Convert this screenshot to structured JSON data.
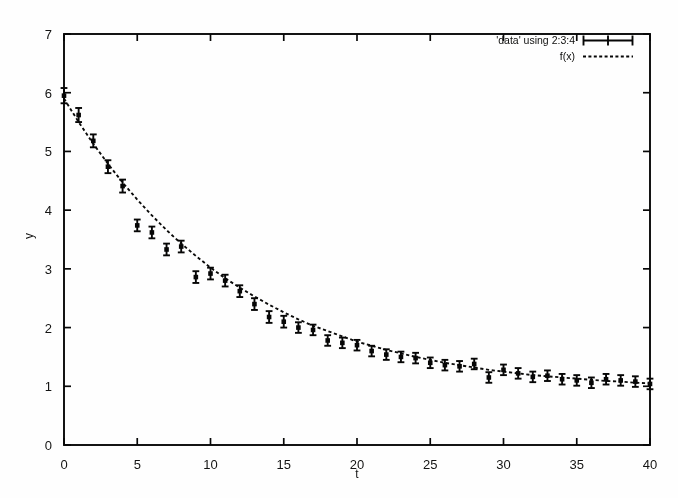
{
  "figure": {
    "kind": "gnuplot-scatter-with-errorbars-and-fit",
    "background_color": "#fdfdfc",
    "ink_color": "#0d0d0d"
  },
  "legend": {
    "position": "top-right-inside",
    "entries": [
      {
        "label": "'data' using 2:3:4",
        "key": "errorbar-key",
        "color": "#0b0b0b"
      },
      {
        "label": "f(x)",
        "key": "dashed-line-key",
        "color": "#0b0b0b"
      }
    ]
  },
  "axes": {
    "x": {
      "label": "t",
      "min": 0,
      "max": 40,
      "ticks": [
        0,
        5,
        10,
        15,
        20,
        25,
        30,
        35,
        40
      ]
    },
    "y": {
      "label": "y",
      "min": 0,
      "max": 7,
      "ticks": [
        0,
        1,
        2,
        3,
        4,
        5,
        6,
        7
      ]
    }
  },
  "chart_data": {
    "type": "scatter",
    "title": "",
    "xlabel": "t",
    "ylabel": "y",
    "xlim": [
      0,
      40
    ],
    "ylim": [
      0,
      7
    ],
    "grid": false,
    "legend_position": "top right inside",
    "series": [
      {
        "name": "'data' using 2:3:4",
        "style": "points-with-yerrorbars",
        "x": [
          0,
          1,
          2,
          3,
          4,
          5,
          6,
          7,
          8,
          9,
          10,
          11,
          12,
          13,
          14,
          15,
          16,
          17,
          18,
          19,
          20,
          21,
          22,
          23,
          24,
          25,
          26,
          27,
          28,
          29,
          30,
          31,
          32,
          33,
          34,
          35,
          36,
          37,
          38,
          39,
          40
        ],
        "y": [
          5.95,
          5.62,
          5.18,
          4.74,
          4.41,
          3.74,
          3.62,
          3.33,
          3.38,
          2.86,
          2.92,
          2.8,
          2.62,
          2.4,
          2.18,
          2.1,
          2.0,
          1.96,
          1.78,
          1.74,
          1.7,
          1.6,
          1.54,
          1.5,
          1.48,
          1.4,
          1.36,
          1.34,
          1.38,
          1.15,
          1.28,
          1.22,
          1.16,
          1.18,
          1.12,
          1.1,
          1.06,
          1.12,
          1.1,
          1.08,
          1.04
        ],
        "yerr": [
          0.13,
          0.12,
          0.11,
          0.11,
          0.11,
          0.1,
          0.1,
          0.1,
          0.1,
          0.1,
          0.1,
          0.1,
          0.1,
          0.1,
          0.1,
          0.1,
          0.09,
          0.09,
          0.09,
          0.09,
          0.09,
          0.09,
          0.09,
          0.09,
          0.09,
          0.09,
          0.09,
          0.09,
          0.09,
          0.09,
          0.09,
          0.09,
          0.09,
          0.09,
          0.09,
          0.09,
          0.09,
          0.09,
          0.09,
          0.09,
          0.09
        ]
      },
      {
        "name": "f(x)",
        "style": "dashed-line",
        "description": "exponential decay fit with constant offset",
        "x": [
          0,
          1,
          2,
          3,
          4,
          5,
          6,
          7,
          8,
          9,
          10,
          11,
          12,
          13,
          14,
          15,
          16,
          17,
          18,
          19,
          20,
          21,
          22,
          23,
          24,
          25,
          26,
          27,
          28,
          29,
          30,
          31,
          32,
          33,
          34,
          35,
          36,
          37,
          38,
          39,
          40
        ],
        "y": [
          5.9,
          5.5,
          5.13,
          4.79,
          4.47,
          4.18,
          3.91,
          3.66,
          3.43,
          3.22,
          3.02,
          2.84,
          2.68,
          2.53,
          2.39,
          2.26,
          2.14,
          2.03,
          1.94,
          1.85,
          1.76,
          1.69,
          1.62,
          1.56,
          1.5,
          1.45,
          1.4,
          1.36,
          1.32,
          1.28,
          1.25,
          1.22,
          1.19,
          1.17,
          1.15,
          1.13,
          1.11,
          1.09,
          1.08,
          1.06,
          1.05
        ]
      }
    ]
  }
}
